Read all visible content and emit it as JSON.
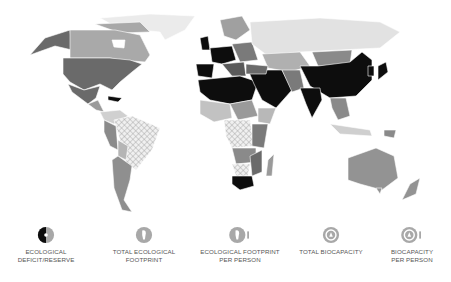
{
  "map": {
    "description": "World map shaded in grayscale by ecological deficit/reserve",
    "colors": {
      "ocean": "#ffffff",
      "deficit_high": "#0d0d0d",
      "dark": "#5f5f5f",
      "medium": "#8a8a8a",
      "light": "#b9b9b9",
      "very_light": "#e4e4e4",
      "hatched_reserve": "#cfcfcf",
      "border": "#ffffff"
    }
  },
  "legend": {
    "items": [
      {
        "id": "deficit-reserve",
        "label_line1": "ECOLOGICAL",
        "label_line2": "DEFICIT/RESERVE",
        "icon": "half-black-circle-icon"
      },
      {
        "id": "total-footprint",
        "label_line1": "TOTAL ECOLOGICAL",
        "label_line2": "FOOTPRINT",
        "icon": "footprint-icon"
      },
      {
        "id": "footprint-per-person",
        "label_line1": "ECOLOGICAL FOOTPRINT",
        "label_line2": "PER PERSON",
        "icon": "footprint-person-icon"
      },
      {
        "id": "total-biocapacity",
        "label_line1": "TOTAL BIOCAPACITY",
        "label_line2": "",
        "icon": "biocapacity-icon"
      },
      {
        "id": "biocapacity-per-person",
        "label_line1": "BIOCAPACITY",
        "label_line2": "PER PERSON",
        "icon": "biocapacity-person-icon"
      }
    ]
  }
}
